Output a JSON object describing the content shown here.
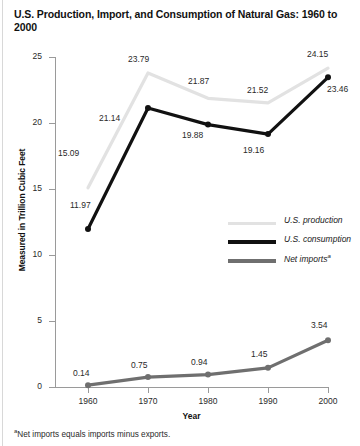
{
  "title": "U.S. Production, Import, and Consumption of Natural Gas: 1960 to 2000",
  "footnote_marker": "a",
  "footnote": "Net imports equals imports minus exports.",
  "legend": {
    "items": [
      {
        "label": "U.S. production",
        "color": "#e2e2e2",
        "weight": "thin",
        "name": "legend-us-production"
      },
      {
        "label": "U.S. consumption",
        "color": "#111111",
        "weight": "thick",
        "name": "legend-us-consumption"
      },
      {
        "label": "Net imports",
        "color": "#6f6f6f",
        "weight": "thick",
        "name": "legend-net-imports",
        "sup": "a"
      }
    ]
  },
  "chart_data": {
    "type": "line",
    "title": "U.S. Production, Import, and Consumption of Natural Gas: 1960 to 2000",
    "xlabel": "Year",
    "ylabel": "Measured in Trillion Cubic Feet",
    "categories": [
      "1960",
      "1970",
      "1980",
      "1990",
      "2000"
    ],
    "x": [
      1960,
      1970,
      1980,
      1990,
      2000
    ],
    "xlim": [
      1960,
      2000
    ],
    "ylim": [
      0,
      25
    ],
    "yticks": [
      "0",
      "5",
      "10",
      "15",
      "20",
      "25"
    ],
    "ytick_values": [
      0,
      5,
      10,
      15,
      20,
      25
    ],
    "grid": false,
    "legend_position": "middle-right",
    "series": [
      {
        "name": "U.S. production",
        "color": "#e2e2e2",
        "values": [
          15.09,
          23.79,
          21.87,
          21.52,
          24.15
        ],
        "labels": [
          "15.09",
          "23.79",
          "21.87",
          "21.52",
          "24.15"
        ]
      },
      {
        "name": "U.S. consumption",
        "color": "#111111",
        "values": [
          11.97,
          21.14,
          19.88,
          19.16,
          23.46
        ],
        "labels": [
          "11.97",
          "21.14",
          "19.88",
          "19.16",
          "23.46"
        ]
      },
      {
        "name": "Net imports",
        "color": "#6f6f6f",
        "values": [
          0.14,
          0.75,
          0.94,
          1.45,
          3.54
        ],
        "labels": [
          "0.14",
          "0.75",
          "0.94",
          "1.45",
          "3.54"
        ]
      }
    ]
  },
  "point_labels": [
    {
      "text": "15.09",
      "left": 58,
      "top": 148,
      "name": "label-production-1960"
    },
    {
      "text": "23.79",
      "left": 128,
      "top": 54,
      "name": "label-production-1970"
    },
    {
      "text": "21.87",
      "left": 188,
      "top": 76,
      "name": "label-production-1980"
    },
    {
      "text": "21.52",
      "left": 247,
      "top": 85,
      "name": "label-production-1990"
    },
    {
      "text": "24.15",
      "left": 307,
      "top": 49,
      "name": "label-production-2000"
    },
    {
      "text": "11.97",
      "left": 70,
      "top": 200,
      "name": "label-consumption-1960"
    },
    {
      "text": "21.14",
      "left": 99,
      "top": 113,
      "name": "label-consumption-1970"
    },
    {
      "text": "19.88",
      "left": 182,
      "top": 130,
      "name": "label-consumption-1980"
    },
    {
      "text": "19.16",
      "left": 243,
      "top": 145,
      "name": "label-consumption-1990"
    },
    {
      "text": "23.46",
      "left": 327,
      "top": 84,
      "name": "label-consumption-2000"
    },
    {
      "text": "0.14",
      "left": 73,
      "top": 368,
      "name": "label-imports-1960"
    },
    {
      "text": "0.75",
      "left": 131,
      "top": 360,
      "name": "label-imports-1970"
    },
    {
      "text": "0.94",
      "left": 191,
      "top": 357,
      "name": "label-imports-1980"
    },
    {
      "text": "1.45",
      "left": 251,
      "top": 349,
      "name": "label-imports-1990"
    },
    {
      "text": "3.54",
      "left": 311,
      "top": 320,
      "name": "label-imports-2000"
    }
  ]
}
